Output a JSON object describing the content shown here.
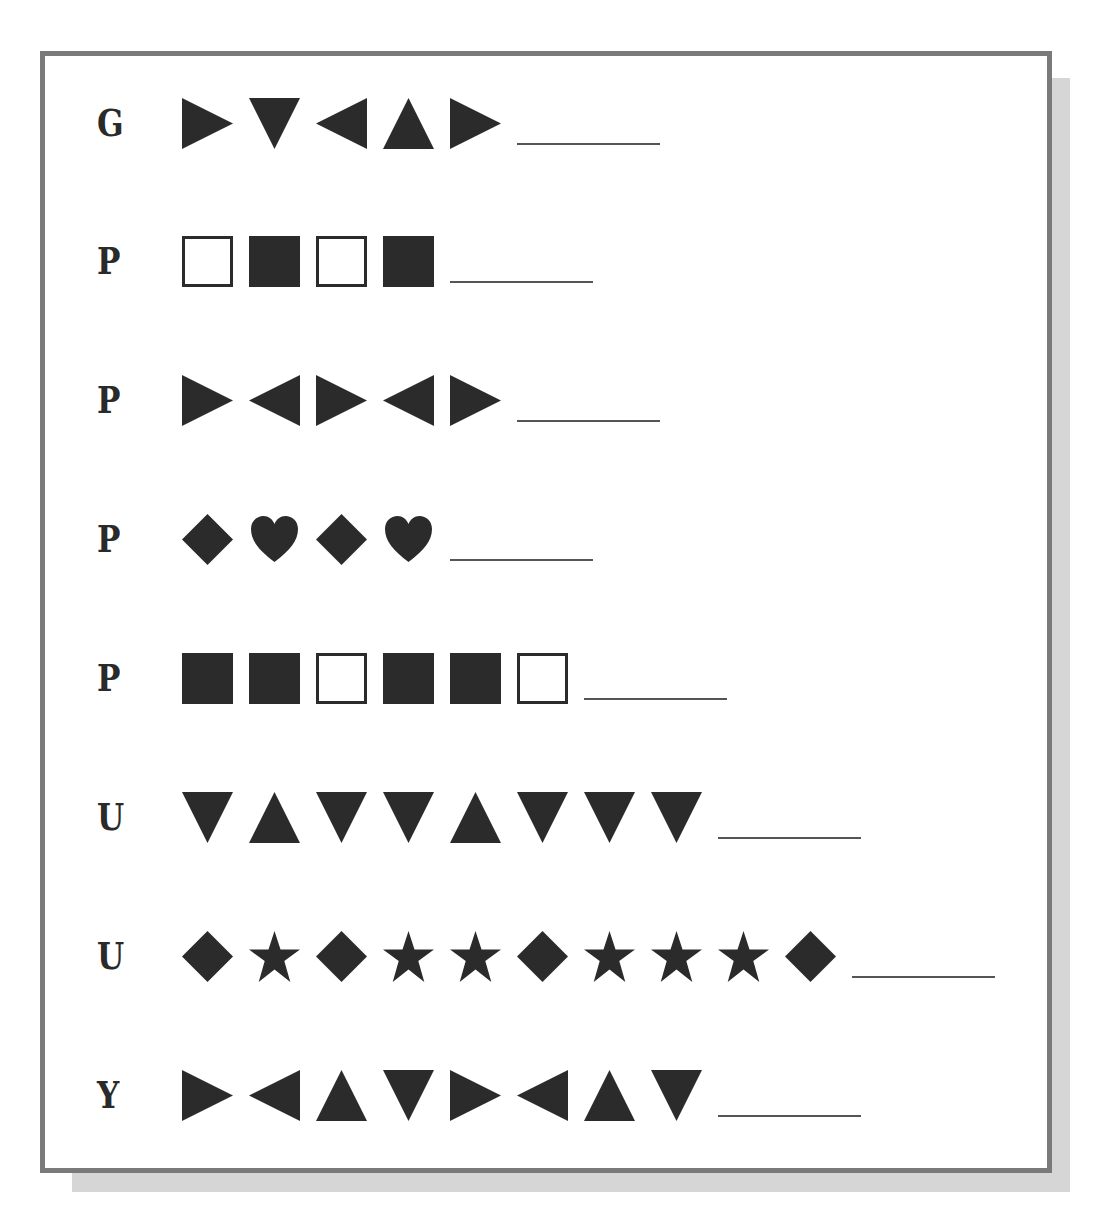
{
  "worksheet": {
    "colors": {
      "shape_fill": "#2b2b2b",
      "border": "#7a7a7a",
      "shadow": "#d6d6d6",
      "blank_line": "#555555"
    },
    "rows": [
      {
        "label": "G",
        "sequence": [
          "triangle-right",
          "triangle-down",
          "triangle-left",
          "triangle-up",
          "triangle-right"
        ],
        "answer": ""
      },
      {
        "label": "P",
        "sequence": [
          "square-outline",
          "square-filled",
          "square-outline",
          "square-filled"
        ],
        "answer": ""
      },
      {
        "label": "P",
        "sequence": [
          "triangle-right",
          "triangle-left",
          "triangle-right",
          "triangle-left",
          "triangle-right"
        ],
        "answer": ""
      },
      {
        "label": "P",
        "sequence": [
          "diamond",
          "heart",
          "diamond",
          "heart"
        ],
        "answer": ""
      },
      {
        "label": "P",
        "sequence": [
          "square-filled",
          "square-filled",
          "square-outline",
          "square-filled",
          "square-filled",
          "square-outline"
        ],
        "answer": ""
      },
      {
        "label": "U",
        "sequence": [
          "triangle-down",
          "triangle-up",
          "triangle-down",
          "triangle-down",
          "triangle-up",
          "triangle-down",
          "triangle-down",
          "triangle-down"
        ],
        "answer": ""
      },
      {
        "label": "U",
        "sequence": [
          "diamond",
          "star",
          "diamond",
          "star",
          "star",
          "diamond",
          "star",
          "star",
          "star",
          "diamond"
        ],
        "answer": ""
      },
      {
        "label": "Y",
        "sequence": [
          "triangle-right",
          "triangle-left",
          "triangle-up",
          "triangle-down",
          "triangle-right",
          "triangle-left",
          "triangle-up",
          "triangle-down"
        ],
        "answer": ""
      }
    ]
  }
}
